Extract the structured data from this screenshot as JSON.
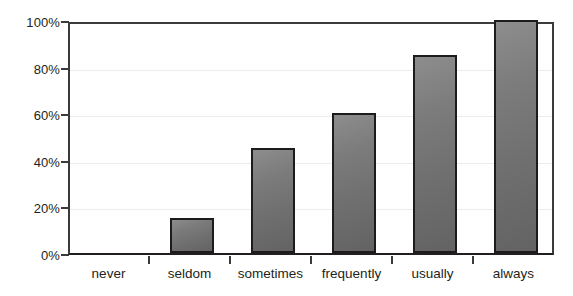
{
  "chart_data": {
    "type": "bar",
    "title": "",
    "subtitle": "",
    "xlabel": "",
    "ylabel": "",
    "categories": [
      "never",
      "seldom",
      "sometimes",
      "frequently",
      "usually",
      "always"
    ],
    "values": [
      0,
      15,
      45,
      60,
      85,
      100
    ],
    "value_unit": "%",
    "ylim": [
      0,
      100
    ],
    "ytick_labels": [
      "0%",
      "20%",
      "40%",
      "60%",
      "80%",
      "100%"
    ],
    "ytick_values": [
      0,
      20,
      40,
      60,
      80,
      100
    ],
    "grid": true,
    "grid_axis": "y",
    "legend": null,
    "legend_position": "none",
    "series": [
      {
        "name": "",
        "values": [
          0,
          15,
          45,
          60,
          85,
          100
        ]
      }
    ],
    "annotations": []
  },
  "style": {
    "bar_fill_light": "#8d8d8d",
    "bar_fill_dark": "#636363",
    "bar_border": "#1c1c1c",
    "axis_color": "#3b3b3b",
    "grid_color": "#ececec",
    "text_color": "#231f20",
    "background": "#ffffff"
  }
}
